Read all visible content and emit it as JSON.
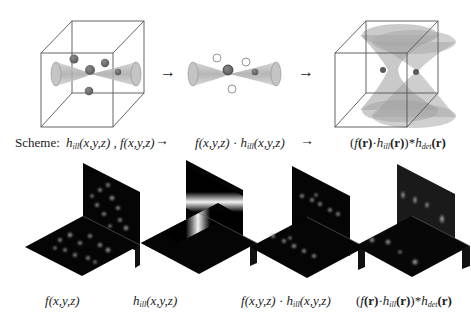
{
  "figure": {
    "top_row": {
      "panels": [
        {
          "id": "volume-with-beam",
          "description": "cube with illumination beam and scattered particles"
        },
        {
          "id": "beam-product",
          "description": "illumination beam multiplied with particles"
        },
        {
          "id": "detection-psf",
          "description": "cube with detection PSF double cones"
        }
      ],
      "arrows": [
        "→",
        "→"
      ]
    },
    "scheme": {
      "label": "Scheme:",
      "step1": {
        "h": "h",
        "h_sub": "ill",
        "h_args": "(x,y,z)",
        "sep": " , ",
        "f": "f",
        "f_args": "(x,y,z)"
      },
      "arrow1": "→",
      "step2": {
        "f": "f",
        "f_args": "(x,y,z)",
        "dot": " · ",
        "h": "h",
        "h_sub": "ill",
        "h_args": "(x,y,z)"
      },
      "arrow2": "→",
      "step3": {
        "open": "(",
        "f": "f",
        "r1": "(r)",
        "dot": "·",
        "h": "h",
        "h_sub": "ill",
        "r2": "(r)",
        "close": ")*",
        "hd": "h",
        "hd_sub": "det",
        "r3": "(r)"
      }
    },
    "bottom_row": {
      "captions": [
        {
          "f": "f",
          "args": "(x,y,z)"
        },
        {
          "h": "h",
          "sub": "ill",
          "args": "(x,y,z)"
        },
        {
          "f": "f",
          "args": "(x,y,z)",
          "dot": " · ",
          "h": "h",
          "sub": "ill",
          "args2": "(x,y,z)"
        },
        {
          "open": "(",
          "f": "f",
          "r1": "(r)",
          "dot": "·",
          "h": "h",
          "sub": "ill",
          "r2": "(r)",
          "close": ")*",
          "hd": "h",
          "hd_sub": "det",
          "r3": "(r)"
        }
      ]
    }
  },
  "colors": {
    "cube_line": "#555555",
    "beam_fill": "#b5b5b5",
    "particle": "#6a6a6a",
    "panel_bg": "#050505",
    "background": "#ffffff"
  }
}
